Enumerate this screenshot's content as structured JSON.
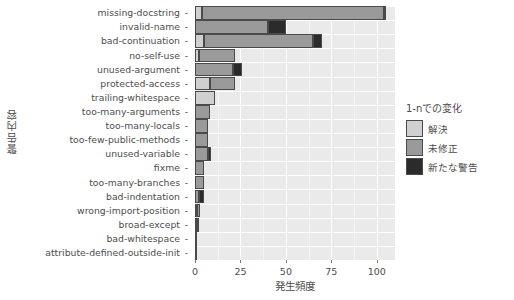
{
  "chart_data": {
    "type": "bar",
    "orientation": "horizontal",
    "stacked": true,
    "title": "",
    "xlabel": "発生頻度",
    "ylabel": "警告内容",
    "xlim": [
      0,
      110
    ],
    "xticks": [
      0,
      25,
      50,
      75,
      100
    ],
    "grid": true,
    "legend_position": "right",
    "legend_title": "1-nでの変化",
    "categories": [
      "missing-docstring",
      "invalid-name",
      "bad-continuation",
      "no-self-use",
      "unused-argument",
      "protected-access",
      "trailing-whitespace",
      "too-many-arguments",
      "too-many-locals",
      "too-few-public-methods",
      "unused-variable",
      "fixme",
      "too-many-branches",
      "bad-indentation",
      "wrong-import-position",
      "broad-except",
      "bad-whitespace",
      "attribute-defined-outside-init"
    ],
    "series": [
      {
        "name": "解決",
        "color": "#d0d0d0",
        "values": [
          4,
          0,
          5,
          2,
          0,
          8,
          11,
          0,
          0,
          0,
          0,
          0,
          0,
          0,
          1,
          1,
          0,
          0
        ]
      },
      {
        "name": "未修正",
        "color": "#9a9a9a",
        "values": [
          100,
          40,
          60,
          20,
          21,
          14,
          0,
          8,
          7,
          7,
          7,
          5,
          5,
          2,
          2,
          1,
          1,
          1
        ]
      },
      {
        "name": "新たな警告",
        "color": "#2b2b2b",
        "values": [
          1,
          10,
          5,
          0,
          5,
          0,
          0,
          0,
          0,
          0,
          2,
          0,
          0,
          3,
          0,
          0,
          0,
          0
        ]
      }
    ]
  }
}
